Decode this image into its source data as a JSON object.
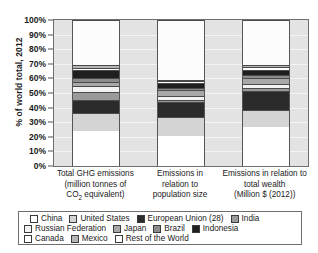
{
  "axis": {
    "y_title": "% of world total, 2012",
    "y_ticks": [
      "100%",
      "90%",
      "80%",
      "70%",
      "60%",
      "50%",
      "40%",
      "30%",
      "20%",
      "10%",
      "0%"
    ]
  },
  "categories": [
    {
      "line1": "Total GHG emissions",
      "line2": "(million tonnes of",
      "line3": "CO",
      "sub": "2",
      "line3b": " equivalent)"
    },
    {
      "line1": "Emissions in",
      "line2": "relation to",
      "line3": "population size",
      "sub": "",
      "line3b": ""
    },
    {
      "line1": "Emissions in relation to",
      "line2": "total wealth",
      "line3": "(Million $ (2012))",
      "sub": "",
      "line3b": ""
    }
  ],
  "legend": {
    "rows": [
      [
        {
          "label": "China",
          "color": "#ffffff"
        },
        {
          "label": "United States",
          "color": "#d4d4d4"
        },
        {
          "label": "European Union (28)",
          "color": "#2b2b2b"
        },
        {
          "label": "India",
          "color": "#9a9a9a"
        }
      ],
      [
        {
          "label": "Russian Federation",
          "color": "#f2f2f2"
        },
        {
          "label": "Japan",
          "color": "#a8a8a8"
        },
        {
          "label": "Brazil",
          "color": "#8c8c8c"
        },
        {
          "label": "Indonesia",
          "color": "#1f1f1f"
        }
      ],
      [
        {
          "label": "Canada",
          "color": "#ffffff"
        },
        {
          "label": "Mexico",
          "color": "#b5b5b5"
        },
        {
          "label": "Rest of the World",
          "color": "#fcfcfc"
        }
      ]
    ]
  },
  "chart_data": {
    "type": "bar",
    "subtype": "stacked-100-percent",
    "title": "",
    "xlabel": "",
    "ylabel": "% of world total, 2012",
    "ylim": [
      0,
      100
    ],
    "ytick_step": 10,
    "grid": true,
    "legend_position": "bottom",
    "categories": [
      "Total GHG emissions (million tonnes of CO2 equivalent)",
      "Emissions in relation to population size",
      "Emissions in relation to total wealth (Million $ (2012))"
    ],
    "series": [
      {
        "name": "China",
        "color": "#ffffff",
        "values": [
          24.0,
          20.5,
          26.5
        ]
      },
      {
        "name": "United States",
        "color": "#d4d4d4",
        "values": [
          12.5,
          13.0,
          12.0
        ]
      },
      {
        "name": "European Union (28)",
        "color": "#2b2b2b",
        "values": [
          8.5,
          10.5,
          13.0
        ]
      },
      {
        "name": "India",
        "color": "#9a9a9a",
        "values": [
          5.5,
          1.5,
          2.0
        ]
      },
      {
        "name": "Russian Federation",
        "color": "#f2f2f2",
        "values": [
          4.5,
          2.5,
          3.0
        ]
      },
      {
        "name": "Japan",
        "color": "#a8a8a8",
        "values": [
          2.8,
          4.0,
          4.0
        ]
      },
      {
        "name": "Brazil",
        "color": "#8c8c8c",
        "values": [
          2.5,
          1.5,
          2.0
        ]
      },
      {
        "name": "Indonesia",
        "color": "#1f1f1f",
        "values": [
          5.5,
          3.5,
          3.5
        ]
      },
      {
        "name": "Canada",
        "color": "#ffffff",
        "values": [
          1.5,
          1.0,
          1.5
        ]
      },
      {
        "name": "Mexico",
        "color": "#b5b5b5",
        "values": [
          1.7,
          1.0,
          1.5
        ]
      },
      {
        "name": "Rest of the World",
        "color": "#fcfcfc",
        "values": [
          31.0,
          41.0,
          31.0
        ]
      }
    ]
  }
}
